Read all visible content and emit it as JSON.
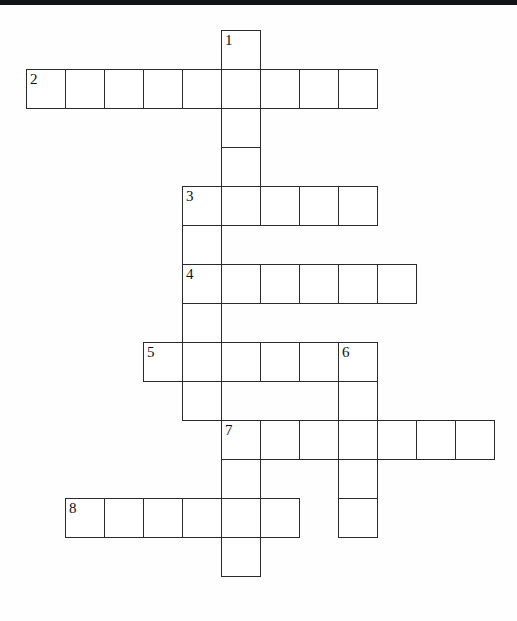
{
  "page": {
    "kind": "crossword-puzzle-grid",
    "width": 517,
    "height": 621,
    "background_color": "#ffffff",
    "top_bar_color": "#111315",
    "cell_border_color": "#2b2b2b",
    "cell_fill_color": "#ffffff",
    "number_color": "#101010"
  },
  "grid": {
    "cell_size": 39,
    "origin_x": 26,
    "origin_y": 30,
    "columns": 12,
    "rows": 14
  },
  "clue_numbers": [
    "1",
    "2",
    "3",
    "4",
    "5",
    "6",
    "7",
    "8"
  ],
  "entries": [
    {
      "number": "1",
      "direction": "down",
      "length": 4,
      "start_col": 5,
      "start_row": 0,
      "numbered": true
    },
    {
      "number": "2",
      "direction": "across",
      "length": 9,
      "start_col": 0,
      "start_row": 1,
      "numbered": true
    },
    {
      "number": "3",
      "direction": "across",
      "length": 5,
      "start_col": 4,
      "start_row": 4,
      "numbered": true
    },
    {
      "number": "3",
      "direction": "down",
      "length": 2,
      "start_col": 4,
      "start_row": 4,
      "numbered": false
    },
    {
      "number": "4",
      "direction": "across",
      "length": 6,
      "start_col": 4,
      "start_row": 6,
      "numbered": true
    },
    {
      "number": "4",
      "direction": "down",
      "length": 2,
      "start_col": 4,
      "start_row": 6,
      "numbered": false
    },
    {
      "number": "5",
      "direction": "across",
      "length": 6,
      "start_col": 3,
      "start_row": 8,
      "numbered": true
    },
    {
      "number": "5",
      "direction": "down",
      "length": 2,
      "start_col": 3,
      "start_row": 8,
      "numbered": false
    },
    {
      "number": "6",
      "direction": "down",
      "length": 5,
      "start_col": 8,
      "start_row": 8,
      "numbered": true
    },
    {
      "number": "7",
      "direction": "across",
      "length": 7,
      "start_col": 5,
      "start_row": 10,
      "numbered": true
    },
    {
      "number": "7",
      "direction": "down",
      "length": 4,
      "start_col": 5,
      "start_row": 10,
      "numbered": false
    },
    {
      "number": "8",
      "direction": "across",
      "length": 6,
      "start_col": 1,
      "start_row": 12,
      "numbered": true
    }
  ],
  "cells": [
    {
      "col": 5,
      "row": 0,
      "number": "1"
    },
    {
      "col": 0,
      "row": 1,
      "number": "2"
    },
    {
      "col": 1,
      "row": 1,
      "number": ""
    },
    {
      "col": 2,
      "row": 1,
      "number": ""
    },
    {
      "col": 3,
      "row": 1,
      "number": ""
    },
    {
      "col": 4,
      "row": 1,
      "number": ""
    },
    {
      "col": 5,
      "row": 1,
      "number": ""
    },
    {
      "col": 6,
      "row": 1,
      "number": ""
    },
    {
      "col": 7,
      "row": 1,
      "number": ""
    },
    {
      "col": 8,
      "row": 1,
      "number": ""
    },
    {
      "col": 5,
      "row": 2,
      "number": ""
    },
    {
      "col": 5,
      "row": 3,
      "number": ""
    },
    {
      "col": 4,
      "row": 4,
      "number": "3"
    },
    {
      "col": 5,
      "row": 4,
      "number": ""
    },
    {
      "col": 6,
      "row": 4,
      "number": ""
    },
    {
      "col": 7,
      "row": 4,
      "number": ""
    },
    {
      "col": 8,
      "row": 4,
      "number": ""
    },
    {
      "col": 4,
      "row": 5,
      "number": ""
    },
    {
      "col": 4,
      "row": 6,
      "number": "4"
    },
    {
      "col": 5,
      "row": 6,
      "number": ""
    },
    {
      "col": 6,
      "row": 6,
      "number": ""
    },
    {
      "col": 7,
      "row": 6,
      "number": ""
    },
    {
      "col": 8,
      "row": 6,
      "number": ""
    },
    {
      "col": 9,
      "row": 6,
      "number": ""
    },
    {
      "col": 4,
      "row": 7,
      "number": ""
    },
    {
      "col": 3,
      "row": 8,
      "number": "5"
    },
    {
      "col": 4,
      "row": 8,
      "number": ""
    },
    {
      "col": 5,
      "row": 8,
      "number": ""
    },
    {
      "col": 6,
      "row": 8,
      "number": ""
    },
    {
      "col": 7,
      "row": 8,
      "number": ""
    },
    {
      "col": 8,
      "row": 8,
      "number": "6"
    },
    {
      "col": 4,
      "row": 9,
      "number": ""
    },
    {
      "col": 8,
      "row": 9,
      "number": ""
    },
    {
      "col": 5,
      "row": 10,
      "number": "7"
    },
    {
      "col": 6,
      "row": 10,
      "number": ""
    },
    {
      "col": 7,
      "row": 10,
      "number": ""
    },
    {
      "col": 8,
      "row": 10,
      "number": ""
    },
    {
      "col": 9,
      "row": 10,
      "number": ""
    },
    {
      "col": 10,
      "row": 10,
      "number": ""
    },
    {
      "col": 11,
      "row": 10,
      "number": ""
    },
    {
      "col": 5,
      "row": 11,
      "number": ""
    },
    {
      "col": 8,
      "row": 11,
      "number": ""
    },
    {
      "col": 1,
      "row": 12,
      "number": "8"
    },
    {
      "col": 2,
      "row": 12,
      "number": ""
    },
    {
      "col": 3,
      "row": 12,
      "number": ""
    },
    {
      "col": 4,
      "row": 12,
      "number": ""
    },
    {
      "col": 5,
      "row": 12,
      "number": ""
    },
    {
      "col": 6,
      "row": 12,
      "number": ""
    },
    {
      "col": 8,
      "row": 12,
      "number": ""
    },
    {
      "col": 5,
      "row": 13,
      "number": ""
    }
  ]
}
